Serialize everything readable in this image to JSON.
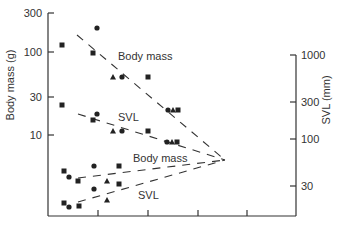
{
  "chart_data": {
    "type": "scatter",
    "title": "",
    "xlabel": "",
    "x_ticks_px": [
      98,
      148,
      198,
      247
    ],
    "left_axis": {
      "label": "Body mass (g)",
      "scale": "log",
      "ticks": [
        "300",
        "100",
        "30",
        "10"
      ],
      "tick_values": [
        300,
        100,
        30,
        10
      ],
      "tick_px": [
        13,
        52,
        97,
        135
      ]
    },
    "right_axis": {
      "label": "SVL (mm)",
      "scale": "log",
      "ticks": [
        "1000",
        "300",
        "100",
        "30"
      ],
      "tick_values": [
        1000,
        300,
        100,
        30
      ],
      "tick_px": [
        55,
        102,
        139,
        186
      ]
    },
    "annotations": [
      {
        "text": "Body mass",
        "x": 118,
        "y": 60
      },
      {
        "text": "SVL",
        "x": 118,
        "y": 121
      },
      {
        "text": "Body mass",
        "x": 133,
        "y": 162
      },
      {
        "text": "SVL",
        "x": 138,
        "y": 199
      }
    ],
    "series": [
      {
        "name": "Body mass (upper, left axis)",
        "axis": "left",
        "points": [
          {
            "px": 62,
            "py": 45,
            "marker": "square",
            "value": 122
          },
          {
            "px": 97,
            "py": 28,
            "marker": "circle",
            "value": 196
          },
          {
            "px": 93,
            "py": 53,
            "marker": "square",
            "value": 97
          },
          {
            "px": 113,
            "py": 77,
            "marker": "triangle",
            "value": 50
          },
          {
            "px": 122,
            "py": 77,
            "marker": "circle",
            "value": 50
          },
          {
            "px": 148,
            "py": 77,
            "marker": "square",
            "value": 50
          },
          {
            "px": 168,
            "py": 110,
            "marker": "circle",
            "value": 20
          },
          {
            "px": 173,
            "py": 110,
            "marker": "triangle",
            "value": 20
          },
          {
            "px": 178,
            "py": 110,
            "marker": "square",
            "value": 20
          }
        ],
        "trend": {
          "from": [
            77,
            35
          ],
          "to": [
            225,
            160
          ]
        }
      },
      {
        "name": "SVL (upper, left axis)",
        "axis": "left",
        "points": [
          {
            "px": 62,
            "py": 105,
            "marker": "square",
            "value": 23
          },
          {
            "px": 97,
            "py": 114,
            "marker": "circle",
            "value": 18
          },
          {
            "px": 93,
            "py": 120,
            "marker": "square",
            "value": 15
          },
          {
            "px": 113,
            "py": 131,
            "marker": "triangle",
            "value": 11
          },
          {
            "px": 122,
            "py": 131,
            "marker": "circle",
            "value": 11
          },
          {
            "px": 148,
            "py": 131,
            "marker": "square",
            "value": 11
          },
          {
            "px": 167,
            "py": 142,
            "marker": "circle",
            "value": 8
          },
          {
            "px": 172,
            "py": 142,
            "marker": "triangle",
            "value": 8
          },
          {
            "px": 177,
            "py": 142,
            "marker": "square",
            "value": 8
          }
        ],
        "trend": {
          "from": [
            78,
            114
          ],
          "to": [
            225,
            160
          ]
        }
      },
      {
        "name": "Body mass (lower, right axis)",
        "axis": "right",
        "points": [
          {
            "px": 64,
            "py": 171,
            "marker": "square",
            "value": 42
          },
          {
            "px": 69,
            "py": 177,
            "marker": "circle",
            "value": 35
          },
          {
            "px": 78,
            "py": 181,
            "marker": "square",
            "value": 32
          },
          {
            "px": 94,
            "py": 166,
            "marker": "circle",
            "value": 48
          },
          {
            "px": 107,
            "py": 181,
            "marker": "triangle",
            "value": 32
          },
          {
            "px": 119,
            "py": 166,
            "marker": "square",
            "value": 48
          },
          {
            "px": 119,
            "py": 184,
            "marker": "square",
            "value": 29
          }
        ],
        "trend": {
          "from": [
            78,
            178
          ],
          "to": [
            225,
            160
          ]
        }
      },
      {
        "name": "SVL (lower, right axis)",
        "axis": "right",
        "points": [
          {
            "px": 64,
            "py": 203,
            "marker": "square",
            "value": 17
          },
          {
            "px": 69,
            "py": 207,
            "marker": "circle",
            "value": 15
          },
          {
            "px": 79,
            "py": 206,
            "marker": "square",
            "value": 16
          },
          {
            "px": 94,
            "py": 189,
            "marker": "circle",
            "value": 25
          },
          {
            "px": 107,
            "py": 200,
            "marker": "triangle",
            "value": 19
          }
        ],
        "trend": {
          "from": [
            78,
            202
          ],
          "to": [
            225,
            160
          ]
        }
      }
    ],
    "grid": false,
    "legend": null
  }
}
